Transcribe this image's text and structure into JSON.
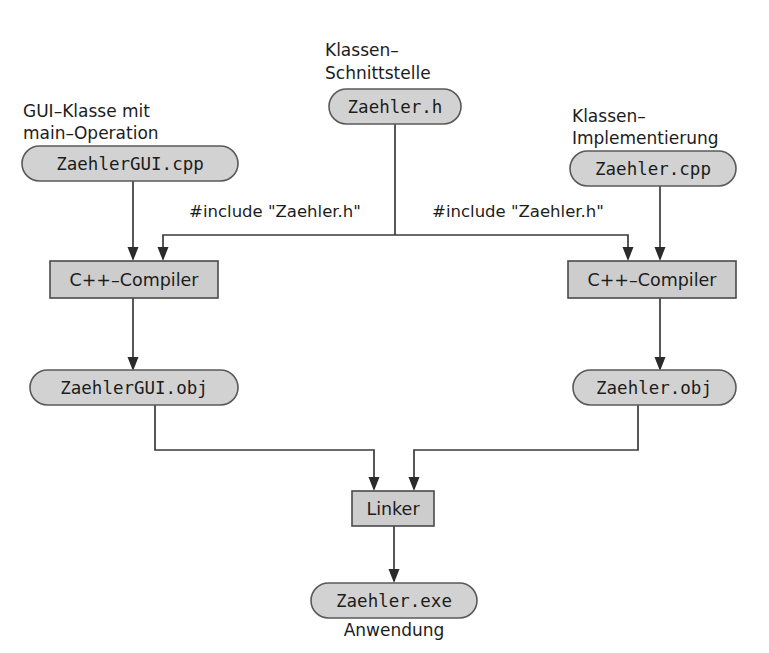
{
  "diagram": {
    "colors": {
      "process_fill": "#cdcdcd",
      "artifact_fill": "#d2d2d2",
      "stroke": "#4a4a4a",
      "line": "#3a3a3a",
      "text": "#1c1c1c",
      "background": "#ffffff"
    },
    "annotations": {
      "gui_class_line1": "GUI–Klasse mit",
      "gui_class_line2": "main–Operation",
      "interface_line1": "Klassen–",
      "interface_line2": "Schnittstelle",
      "implementation_line1": "Klassen–",
      "implementation_line2": "Implementierung",
      "application": "Anwendung"
    },
    "nodes": {
      "zaehler_gui_cpp": "ZaehlerGUI.cpp",
      "zaehler_h": "Zaehler.h",
      "zaehler_cpp": "Zaehler.cpp",
      "compiler_left": "C++–Compiler",
      "compiler_right": "C++–Compiler",
      "zaehler_gui_obj": "ZaehlerGUI.obj",
      "zaehler_obj": "Zaehler.obj",
      "linker": "Linker",
      "zaehler_exe": "Zaehler.exe"
    },
    "edge_labels": {
      "include_left": "#include \"Zaehler.h\"",
      "include_right": "#include \"Zaehler.h\""
    }
  }
}
